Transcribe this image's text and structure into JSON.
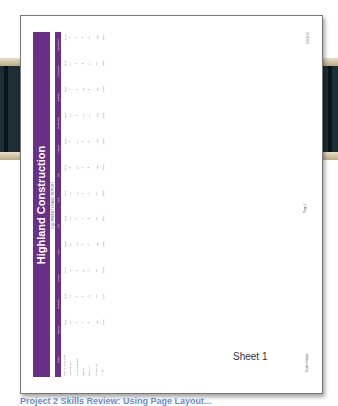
{
  "document": {
    "title": "Highland Construction",
    "subtitle": "EQUIPMENT USAGE REPORT",
    "header_color": "#6a2f86",
    "columns": [
      "Hours",
      "January",
      "February",
      "March",
      "April",
      "May",
      "June",
      "July",
      "August",
      "September",
      "October",
      "November",
      "December"
    ],
    "rows": [
      {
        "label": "Total hours available",
        "values": [
          2568,
          2400,
          2520,
          2400,
          2480,
          2390,
          2520,
          2528,
          2390,
          2460,
          2428,
          2328
        ]
      },
      {
        "label": "Available days",
        "values": [
          19,
          11,
          18,
          20,
          14,
          15,
          8,
          8,
          12,
          7,
          12,
          5
        ]
      },
      {
        "label": "Unavailable days",
        "values": [
          8,
          6,
          8,
          10,
          6,
          15,
          10,
          12,
          8,
          8,
          5,
          7
        ]
      },
      {
        "label": "Repairs",
        "values": [
          3,
          7,
          12,
          6,
          9,
          8,
          7,
          8,
          10,
          10,
          8,
          8
        ]
      },
      {
        "label": "Servicing",
        "values": [
          4,
          13,
          7,
          6,
          8,
          9,
          8,
          5,
          12,
          8,
          11,
          12
        ]
      },
      {
        "label": "Unassigned",
        "values": [
          128,
          95,
          85,
          135,
          85,
          75,
          140,
          120,
          120,
          113,
          95,
          128
        ]
      },
      {
        "label": "In use",
        "values": [
          1940,
          2225,
          2328,
          2180,
          2092,
          1985,
          2020,
          2250,
          1180,
          1945,
          2005,
          1835
        ]
      }
    ],
    "footer": {
      "date": "6/1/2012",
      "page": "Page 1",
      "student": "Student Name"
    }
  },
  "sheet_label": "Sheet 1",
  "caption": "Project 2 Skills Review: Using Page Layout..."
}
